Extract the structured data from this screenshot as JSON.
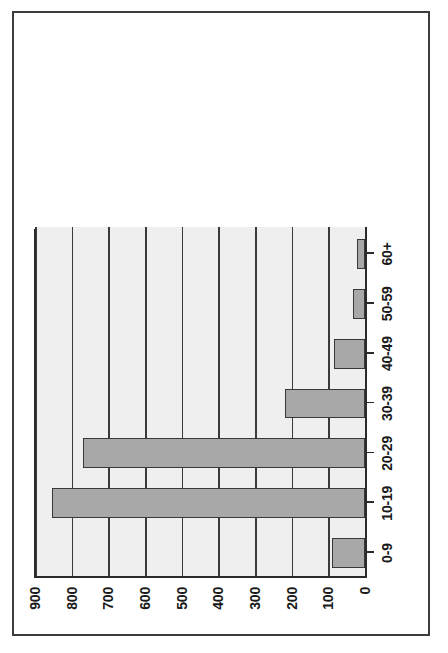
{
  "chart_data": {
    "type": "bar",
    "orientation": "vertical-rotated-90ccw",
    "title": "",
    "subtitle": "",
    "xlabel": "",
    "ylabel": "",
    "categories": [
      "0-9",
      "10-19",
      "20-29",
      "30-39",
      "40-49",
      "50-59",
      "60+"
    ],
    "values": [
      90,
      853,
      768,
      219,
      85,
      34,
      23
    ],
    "ylim": [
      0,
      900
    ],
    "ytick_labels": [
      "0",
      "100",
      "200",
      "300",
      "400",
      "500",
      "600",
      "700",
      "800",
      "900"
    ],
    "ytick_values": [
      0,
      100,
      200,
      300,
      400,
      500,
      600,
      700,
      800,
      900
    ],
    "grid": true,
    "grid_axis": "y",
    "legend": null,
    "legend_position": "none",
    "annotations": [],
    "series": [
      {
        "name": "count",
        "values": [
          90,
          853,
          768,
          219,
          85,
          34,
          23
        ]
      }
    ]
  },
  "style": {
    "bar_fill": "#a8a8a8",
    "bar_border": "#383838",
    "plot_background": "#efefef",
    "page_background": "#ffffff",
    "grid_color": "#3a3a3a",
    "axis_color": "#2b2b2b",
    "text_color": "#1a1a1a",
    "frame_color": "#3c3c3c"
  }
}
